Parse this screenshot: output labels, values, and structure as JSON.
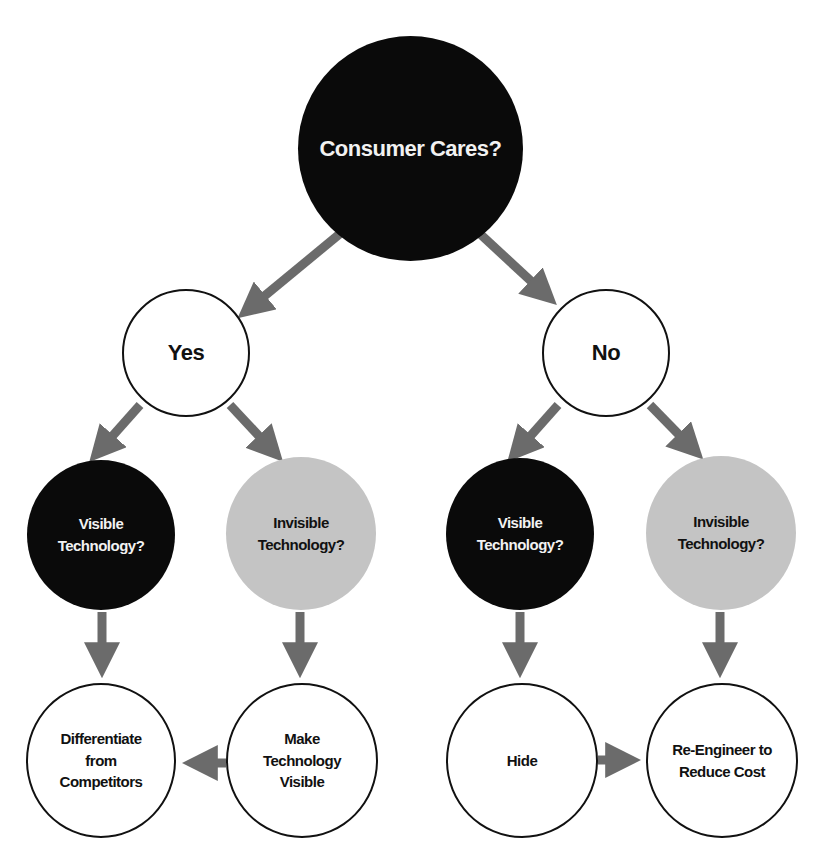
{
  "diagram": {
    "type": "decision-tree",
    "colors": {
      "black_node": "#0a0a0a",
      "gray_node": "#c4c4c4",
      "white_node": "#ffffff",
      "arrow": "#6b6b6b"
    },
    "nodes": {
      "root": {
        "label": "Consumer Cares?",
        "style": "black"
      },
      "yes": {
        "label": "Yes",
        "style": "white"
      },
      "no": {
        "label": "No",
        "style": "white"
      },
      "yes_visible": {
        "label": "Visible\nTechnology?",
        "style": "black"
      },
      "yes_invisible": {
        "label": "Invisible\nTechnology?",
        "style": "gray"
      },
      "no_visible": {
        "label": "Visible\nTechnology?",
        "style": "black"
      },
      "no_invisible": {
        "label": "Invisible\nTechnology?",
        "style": "gray"
      },
      "differentiate": {
        "label": "Differentiate\nfrom\nCompetitors",
        "style": "white"
      },
      "make_visible": {
        "label": "Make\nTechnology\nVisible",
        "style": "white"
      },
      "hide": {
        "label": "Hide",
        "style": "white"
      },
      "reengineer": {
        "label": "Re-Engineer to\nReduce Cost",
        "style": "white"
      }
    },
    "edges": [
      {
        "from": "root",
        "to": "yes"
      },
      {
        "from": "root",
        "to": "no"
      },
      {
        "from": "yes",
        "to": "yes_visible"
      },
      {
        "from": "yes",
        "to": "yes_invisible"
      },
      {
        "from": "no",
        "to": "no_visible"
      },
      {
        "from": "no",
        "to": "no_invisible"
      },
      {
        "from": "yes_visible",
        "to": "differentiate"
      },
      {
        "from": "yes_invisible",
        "to": "make_visible"
      },
      {
        "from": "make_visible",
        "to": "differentiate"
      },
      {
        "from": "no_visible",
        "to": "hide"
      },
      {
        "from": "no_invisible",
        "to": "reengineer"
      },
      {
        "from": "hide",
        "to": "reengineer"
      }
    ]
  }
}
